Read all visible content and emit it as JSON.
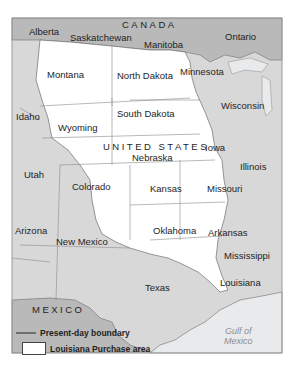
{
  "map": {
    "colors": {
      "louisiana_purchase": "#ffffff",
      "other_us": "#d8d8d8",
      "foreign": "#b9b9b9",
      "water": "#e9eaec",
      "boundary": "#6e6e6e",
      "frame": "#9a9a9a"
    },
    "countries": {
      "canada": "CANADA",
      "united_states": "UNITED STATES",
      "mexico": "MEXICO"
    },
    "provinces": {
      "alberta": "Alberta",
      "saskatchewan": "Saskatchewan",
      "manitoba": "Manitoba",
      "ontario": "Ontario"
    },
    "states": {
      "montana": "Montana",
      "north_dakota": "North Dakota",
      "minnesota": "Minnesota",
      "idaho": "Idaho",
      "wyoming": "Wyoming",
      "south_dakota": "South Dakota",
      "wisconsin": "Wisconsin",
      "iowa": "Iowa",
      "nebraska": "Nebraska",
      "utah": "Utah",
      "colorado": "Colorado",
      "illinois": "Illinois",
      "kansas": "Kansas",
      "missouri": "Missouri",
      "arizona": "Arizona",
      "new_mexico": "New Mexico",
      "oklahoma": "Oklahoma",
      "arkansas": "Arkansas",
      "mississippi": "Mississippi",
      "texas": "Texas",
      "louisiana": "Louisiana"
    },
    "water": {
      "gulf_line1": "Gulf of",
      "gulf_line2": "Mexico"
    },
    "legend": {
      "boundary_label": "Present-day boundary",
      "area_label": "Louisiana Purchase area"
    }
  }
}
